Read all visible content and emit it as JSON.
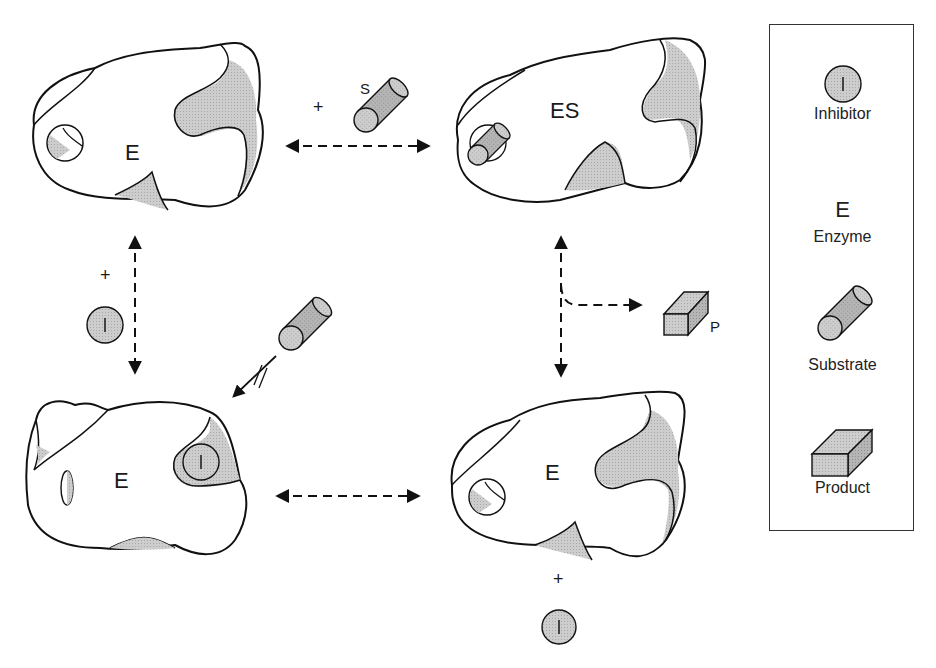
{
  "diagram": {
    "states": {
      "top_left": {
        "label": "E"
      },
      "top_right": {
        "label": "ES"
      },
      "bottom_left": {
        "label": "E",
        "bound_inhibitor": "I"
      },
      "bottom_right": {
        "label": "E"
      }
    },
    "reactions": {
      "top": {
        "plus": "+",
        "substrate_label": "S",
        "arrow": "reversible"
      },
      "left": {
        "plus": "+",
        "inhibitor_label": "I",
        "arrow": "reversible"
      },
      "right": {
        "product_label": "P",
        "arrow": "reversible with branch to product"
      },
      "bottom": {
        "arrow": "reversible",
        "plus": "+",
        "inhibitor_label": "I"
      },
      "blocked": {
        "description": "substrate binding blocked (//)"
      }
    },
    "colors": {
      "outline": "#1a1a1a",
      "shade": "#c8c8c8",
      "shade_dark": "#a9a9a9",
      "background": "#ffffff"
    }
  },
  "legend": {
    "items": [
      {
        "symbol": "I",
        "label": "Inhibitor"
      },
      {
        "symbol": "E",
        "label": "Enzyme"
      },
      {
        "symbol": "cylinder",
        "label": "Substrate"
      },
      {
        "symbol": "box",
        "label": "Product"
      }
    ]
  }
}
